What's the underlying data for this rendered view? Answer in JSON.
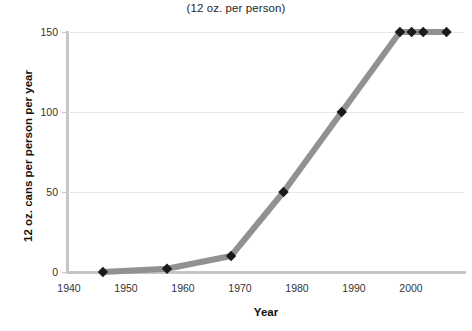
{
  "chart_data": {
    "type": "line",
    "title": "(12 oz. per person)",
    "xlabel": "Year",
    "ylabel": "12 oz. cans per person per year",
    "xlim": [
      1940,
      2008
    ],
    "ylim": [
      0,
      150
    ],
    "xticks": [
      1940,
      1950,
      1960,
      1970,
      1980,
      1990,
      2000
    ],
    "xtick_labels": [
      "1940",
      "1950",
      "1960",
      "1970",
      "1980",
      "1990",
      "2000"
    ],
    "yticks": [
      0,
      50,
      100,
      150
    ],
    "ytick_labels": [
      "0",
      "50",
      "100",
      "150"
    ],
    "grid": "horizontal",
    "legend": "none",
    "series": [
      {
        "name": "12 oz. cans per person per year",
        "line_color": "#919191",
        "marker_color": "#1a1a1a",
        "marker": "diamond",
        "x": [
          1946,
          1957,
          1968,
          1977,
          1987,
          1997,
          1999,
          2001,
          2005
        ],
        "values": [
          0,
          2,
          10,
          50,
          100,
          150,
          150,
          150,
          150
        ]
      }
    ]
  },
  "axes": {
    "y_labels": [
      "150",
      "100",
      "50",
      "0"
    ],
    "x_labels": [
      "1940",
      "1950",
      "1960",
      "1970",
      "1980",
      "1990",
      "2000"
    ],
    "x_title": "Year",
    "y_title": "12 oz. cans per person per year"
  },
  "title": {
    "text": "(12 oz. per person)"
  }
}
